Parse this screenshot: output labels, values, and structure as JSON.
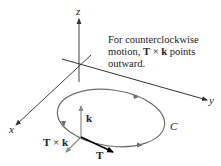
{
  "diagram": {
    "caption": {
      "line1": "For counterclockwise",
      "line2_pre": "motion, ",
      "line2_T": "T",
      "line2_times": " × ",
      "line2_k": "k",
      "line2_post": " points",
      "line3": "outward."
    },
    "axes": {
      "x_label": "x",
      "y_label": "y",
      "z_label": "z"
    },
    "curve_label": "C",
    "vectors": {
      "k_label": "k",
      "T_label": "T",
      "Txk_T": "T",
      "Txk_times": " × ",
      "Txk_k": "k"
    },
    "colors": {
      "axis": "#333333",
      "curve": "#6e6e6e",
      "vector_gray": "#8a8a8a",
      "vector_black": "#000000",
      "text": "#222222"
    }
  }
}
